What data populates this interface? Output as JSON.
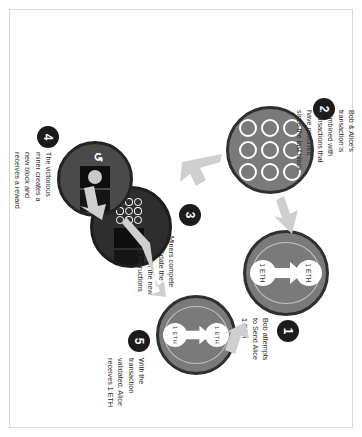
{
  "diagram": {
    "background_color": "#ffffff",
    "frame_color": "#d9d9d9",
    "accent_dark": "#1c1c1c",
    "disc_mid_color": "#7a7a7a",
    "disc_dark_color": "#2e2e2e",
    "disc_dkgray_color": "#4a4a4a"
  },
  "steps": [
    {
      "number": "1",
      "caption": "Bob attempts\nto Send Alice\n1 ETH",
      "coin_top_label": "1 ETH",
      "coin_bottom_label": "1 ETH",
      "icon": "transfer-circle"
    },
    {
      "number": "2",
      "caption": "Bob & Alice's\ntransaction is\ncombined with\ntransactions that\nhave occurred\nsince the last block",
      "icon": "transaction-grid-circle"
    },
    {
      "number": "3",
      "caption": "Miners compete\nto validate the\nblock with the new\nset of instructions",
      "icon": "mining-circle"
    },
    {
      "number": "4",
      "caption": "The victorious\nminer creates a\nnew block and\nreceives a reward",
      "icon": "reward-circle"
    },
    {
      "number": "5",
      "caption": "With the\ntransaction\nvalidated, Alice\nreceives 1 ETH",
      "coin_top_label": "1 ETH",
      "coin_bottom_label": "1 ETH",
      "icon": "transfer-circle"
    }
  ]
}
